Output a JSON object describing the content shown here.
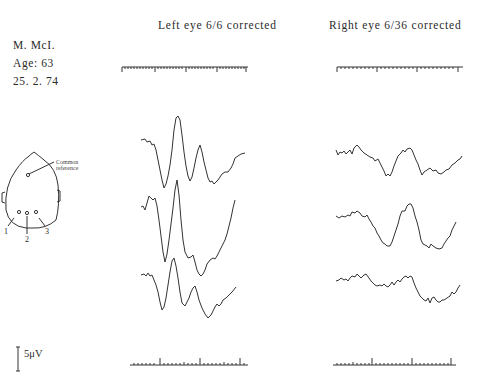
{
  "patient": {
    "name": "M. McI.",
    "age": "Age:  63",
    "date": "25. 2. 74"
  },
  "panels": [
    {
      "title": "Left eye   6/6 corrected",
      "traces": 3
    },
    {
      "title": "Right eye   6/36 corrected",
      "traces": 3
    }
  ],
  "head_diagram": {
    "reference_label_line1": "Common",
    "reference_label_line2": "reference",
    "electrodes": [
      "1",
      "2",
      "3"
    ]
  },
  "calibration": {
    "label": "5μV"
  },
  "colors": {
    "ink": "#2a2a2a",
    "background": "#ffffff"
  }
}
